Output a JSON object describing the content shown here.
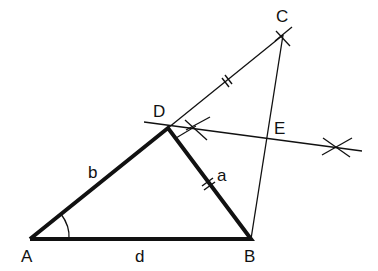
{
  "diagram": {
    "type": "geometric-construction",
    "colors": {
      "stroke": "#111111",
      "background": "#ffffff"
    },
    "points": {
      "A": {
        "label": "A",
        "x": 30,
        "y": 239
      },
      "B": {
        "label": "B",
        "x": 251,
        "y": 239
      },
      "C": {
        "label": "C",
        "x": 283,
        "y": 35
      },
      "D": {
        "label": "D",
        "x": 168,
        "y": 128
      },
      "E": {
        "label": "E",
        "x": 268,
        "y": 137
      }
    },
    "side_labels": {
      "a": "a",
      "b": "b",
      "d": "d"
    },
    "segments": [
      {
        "from": "A",
        "to": "B",
        "weight": "thick",
        "label": "d"
      },
      {
        "from": "A",
        "to": "D",
        "weight": "thick",
        "label": "b"
      },
      {
        "from": "D",
        "to": "B",
        "weight": "thick",
        "label": "a",
        "tick": true
      },
      {
        "from": "D",
        "to": "C",
        "weight": "thin",
        "tick": true
      },
      {
        "from": "B",
        "to": "C",
        "weight": "thin"
      },
      {
        "type": "perpendicular-bisector",
        "weight": "thin"
      }
    ],
    "angle_marks": [
      {
        "at": "A"
      }
    ]
  }
}
